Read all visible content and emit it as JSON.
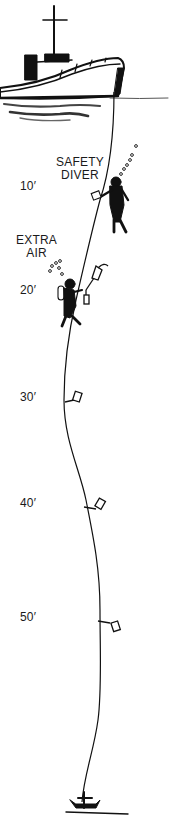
{
  "diagram": {
    "colors": {
      "ink": "#111111",
      "background": "#ffffff",
      "wake": "#555555"
    },
    "callouts": {
      "safety_diver": {
        "line1": "SAFETY",
        "line2": "DIVER"
      },
      "extra_air": {
        "line1": "EXTRA",
        "line2": "AIR"
      }
    },
    "depth_markers": [
      {
        "label": "10′",
        "y": 186
      },
      {
        "label": "20′",
        "y": 290
      },
      {
        "label": "30′",
        "y": 397
      },
      {
        "label": "40′",
        "y": 503
      },
      {
        "label": "50′",
        "y": 617
      }
    ],
    "elements": [
      {
        "name": "boat",
        "icon": "boat-icon"
      },
      {
        "name": "descent-line",
        "icon": "rope-line"
      },
      {
        "name": "safety-diver",
        "icon": "diver-icon"
      },
      {
        "name": "extra-air-diver",
        "icon": "diver-icon"
      },
      {
        "name": "air-tank-tags",
        "icon": "tag-icon"
      },
      {
        "name": "anchor",
        "icon": "anchor-icon"
      }
    ]
  }
}
